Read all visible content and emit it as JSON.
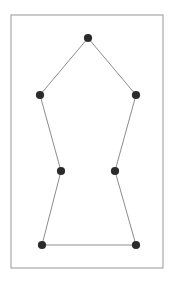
{
  "figure": {
    "canvas": {
      "width": 174,
      "height": 285,
      "background": "#ffffff"
    },
    "frame": {
      "name": "border-frame",
      "x": 11,
      "y": 15,
      "width": 152,
      "height": 253,
      "stroke": "#a8a8a8",
      "stroke_width": 1.2,
      "fill": "#ffffff"
    },
    "style": {
      "edge_color": "#8c8c8c",
      "edge_width": 1,
      "vertex_color": "#2b2b2b",
      "vertex_radius": 4.1
    },
    "vertices": [
      {
        "label": "top-apex",
        "x": 88,
        "y": 38
      },
      {
        "label": "upper-right",
        "x": 136,
        "y": 95
      },
      {
        "label": "middle-right",
        "x": 115,
        "y": 171
      },
      {
        "label": "bottom-right",
        "x": 136,
        "y": 245
      },
      {
        "label": "bottom-left",
        "x": 42,
        "y": 245
      },
      {
        "label": "middle-left",
        "x": 61,
        "y": 171
      },
      {
        "label": "upper-left",
        "x": 40,
        "y": 95
      }
    ],
    "edges": [
      {
        "label": "apex-to-upper-right",
        "from": 0,
        "to": 1
      },
      {
        "label": "upper-right-to-middle-right",
        "from": 1,
        "to": 2
      },
      {
        "label": "middle-right-to-bottom-right",
        "from": 2,
        "to": 3
      },
      {
        "label": "bottom-right-to-bottom-left",
        "from": 3,
        "to": 4
      },
      {
        "label": "bottom-left-to-middle-left",
        "from": 4,
        "to": 5
      },
      {
        "label": "middle-left-to-upper-left",
        "from": 5,
        "to": 6
      },
      {
        "label": "upper-left-to-apex",
        "from": 6,
        "to": 0
      }
    ]
  },
  "chart_data": {
    "type": "scatter",
    "title": "",
    "xlabel": "",
    "ylabel": "",
    "xlim": [
      11,
      163
    ],
    "ylim": [
      15,
      268
    ],
    "grid": false,
    "legend": null,
    "series": [
      {
        "name": "polygon-vertices",
        "closed": true,
        "x": [
          88,
          136,
          115,
          136,
          42,
          61,
          40
        ],
        "y": [
          38,
          95,
          171,
          245,
          245,
          171,
          95
        ],
        "point_labels": [
          "top-apex",
          "upper-right",
          "middle-right",
          "bottom-right",
          "bottom-left",
          "middle-left",
          "upper-left"
        ]
      }
    ],
    "annotations": []
  }
}
